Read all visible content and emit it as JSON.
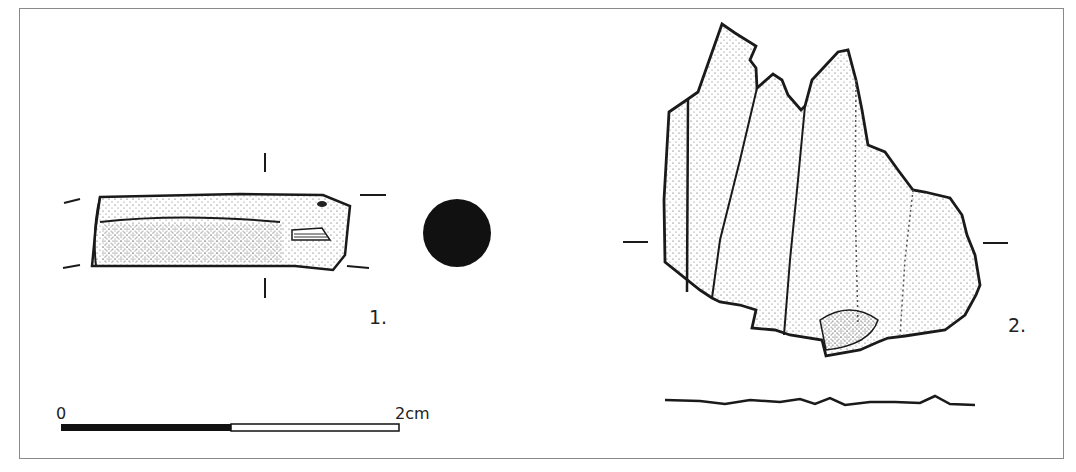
{
  "figure": {
    "items": [
      {
        "id": 1,
        "label": "1.",
        "description": "cylindrical rod fragment, side view and black circular cross-section"
      },
      {
        "id": 2,
        "label": "2.",
        "description": "crystalline cluster fragment, front view with profile line below"
      }
    ],
    "scale_bar": {
      "start_label": "0",
      "end_label": "2cm",
      "segments": [
        {
          "color": "#111111"
        },
        {
          "color": "#ffffff"
        }
      ]
    },
    "colors": {
      "ink": "#1a1a1a",
      "frame": "#8a8a8a",
      "background": "#ffffff"
    }
  }
}
